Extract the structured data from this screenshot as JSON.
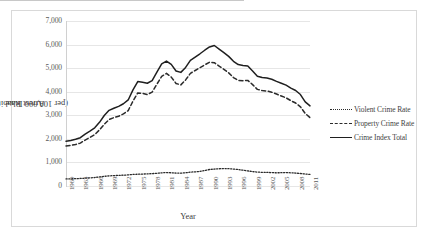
{
  "chart_data": {
    "type": "line",
    "title": "",
    "xlabel": "Year",
    "ylabel": "Arrest Rate (per 100,000 Inhabitants)",
    "ylim": [
      0,
      7000
    ],
    "ytick_labels": [
      "7,000",
      "6,000",
      "5,000",
      "4,000",
      "3,000",
      "2,000",
      "1,000",
      "0"
    ],
    "ytick_values": [
      7000,
      6000,
      5000,
      4000,
      3000,
      2000,
      1000,
      0
    ],
    "grid": true,
    "legend_position": "right",
    "xlim": [
      1960,
      2011
    ],
    "xtick_labels": [
      "1960",
      "1963",
      "1966",
      "1969",
      "1972",
      "1975",
      "1978",
      "1981",
      "1984",
      "1987",
      "1990",
      "1993",
      "1996",
      "1999",
      "2002",
      "2005",
      "2008",
      "2011"
    ],
    "x": [
      1960,
      1961,
      1962,
      1963,
      1964,
      1965,
      1966,
      1967,
      1968,
      1969,
      1970,
      1971,
      1972,
      1973,
      1974,
      1975,
      1976,
      1977,
      1978,
      1979,
      1980,
      1981,
      1982,
      1983,
      1984,
      1985,
      1986,
      1987,
      1988,
      1989,
      1990,
      1991,
      1992,
      1993,
      1994,
      1995,
      1996,
      1997,
      1998,
      1999,
      2000,
      2001,
      2002,
      2003,
      2004,
      2005,
      2006,
      2007,
      2008,
      2009,
      2010,
      2011
    ],
    "series": [
      {
        "name": "Violent Crime Rate",
        "style": "dotted",
        "color": "#2b2b2b",
        "values": [
          300,
          305,
          310,
          320,
          330,
          345,
          360,
          385,
          410,
          430,
          440,
          450,
          460,
          470,
          490,
          500,
          505,
          515,
          525,
          540,
          560,
          570,
          560,
          550,
          545,
          560,
          590,
          600,
          620,
          660,
          700,
          720,
          730,
          740,
          735,
          720,
          700,
          670,
          640,
          610,
          590,
          580,
          575,
          570,
          560,
          565,
          570,
          560,
          550,
          530,
          510,
          490
        ]
      },
      {
        "name": "Property Crime Rate",
        "style": "dashed",
        "color": "#2b2b2b",
        "values": [
          1700,
          1720,
          1760,
          1820,
          1950,
          2060,
          2180,
          2380,
          2620,
          2820,
          2900,
          2960,
          3060,
          3200,
          3600,
          3950,
          3930,
          3880,
          3980,
          4320,
          4650,
          4780,
          4620,
          4350,
          4290,
          4500,
          4780,
          4900,
          5020,
          5140,
          5250,
          5230,
          5090,
          4950,
          4800,
          4600,
          4480,
          4470,
          4480,
          4300,
          4100,
          4050,
          4030,
          3980,
          3900,
          3820,
          3740,
          3620,
          3520,
          3360,
          3080,
          2900
        ]
      },
      {
        "name": "Crime Index Total",
        "style": "solid",
        "color": "#1f1f1f",
        "values": [
          1900,
          1930,
          1980,
          2050,
          2200,
          2330,
          2470,
          2700,
          2990,
          3210,
          3300,
          3380,
          3490,
          3650,
          4080,
          4430,
          4400,
          4360,
          4470,
          4830,
          5180,
          5300,
          5160,
          4880,
          4820,
          5030,
          5330,
          5470,
          5610,
          5760,
          5900,
          5960,
          5810,
          5660,
          5500,
          5290,
          5150,
          5110,
          5090,
          4880,
          4660,
          4600,
          4580,
          4530,
          4440,
          4360,
          4280,
          4150,
          4050,
          3880,
          3570,
          3400
        ]
      }
    ]
  },
  "axis": {
    "y_title": "Arrest Rate (per 100,000 Inhabitants)",
    "y_title_line1": "Arrest Rate",
    "y_title_line2": "(per 100,000 Inhabitants)",
    "x_title": "Year"
  },
  "legend": {
    "items": [
      {
        "label": "Violent Crime Rate",
        "style": "dotted"
      },
      {
        "label": "Property Crime Rate",
        "style": "dashed"
      },
      {
        "label": "Crime Index Total",
        "style": "solid"
      }
    ]
  },
  "colors": {
    "line": "#1f1f1f",
    "grid": "#e6e6e6",
    "border": "#d9d9d9",
    "text": "#595959"
  }
}
